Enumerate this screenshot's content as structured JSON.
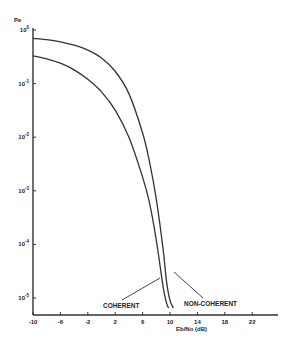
{
  "chart_data": {
    "type": "line",
    "title": "",
    "xlabel": "Eb/No (dB)",
    "ylabel": "Pe",
    "xscale": "linear",
    "yscale": "log",
    "xlim": [
      -10,
      30
    ],
    "ylim": [
      1e-05,
      1
    ],
    "x_ticks": [
      -10,
      -6,
      -2,
      2,
      6,
      10,
      14,
      18,
      22
    ],
    "x_tick_labels": [
      "-10",
      "-6",
      "-2",
      "2",
      "6",
      "10",
      "14",
      "18",
      "22"
    ],
    "y_ticks": [
      1,
      0.1,
      0.01,
      0.001,
      0.0001,
      1e-05
    ],
    "y_tick_labels": [
      {
        "base": "10",
        "exp": "0"
      },
      {
        "base": "10",
        "exp": "-1"
      },
      {
        "base": "10",
        "exp": "-2"
      },
      {
        "base": "10",
        "exp": "-3"
      },
      {
        "base": "10",
        "exp": "-4"
      },
      {
        "base": "10",
        "exp": "-5"
      }
    ],
    "grid": false,
    "legend": "none (curves labelled by annotations with leader lines)",
    "series": [
      {
        "name": "NON-COHERENT",
        "x": [
          -10,
          -8,
          -6,
          -4,
          -2,
          0,
          2,
          4,
          6,
          7,
          8,
          9,
          9.5,
          10,
          10.5
        ],
        "y": [
          0.7,
          0.66,
          0.6,
          0.52,
          0.42,
          0.3,
          0.17,
          0.065,
          0.012,
          0.0035,
          0.0007,
          8e-05,
          2e-05,
          9e-06,
          6.5e-06
        ]
      },
      {
        "name": "COHERENT",
        "x": [
          -10,
          -8,
          -6,
          -4,
          -2,
          0,
          2,
          4,
          6,
          7,
          8,
          9,
          9.5,
          9.8
        ],
        "y": [
          0.33,
          0.29,
          0.24,
          0.18,
          0.12,
          0.07,
          0.032,
          0.01,
          0.0018,
          0.0006,
          0.00012,
          1.6e-05,
          8e-06,
          6.5e-06
        ]
      }
    ],
    "annotations": [
      {
        "text": "COHERENT",
        "points_to": "COHERENT curve near Eb/No≈9.5 dB, Pe≈3e-5"
      },
      {
        "text": "NON-COHERENT",
        "points_to": "NON-COHERENT curve near Eb/No≈10.5 dB, Pe≈3e-5"
      }
    ]
  },
  "labels": {
    "ylabel": "Pe",
    "xlabel": "Eb/No (dB)",
    "ann_coherent": "COHERENT",
    "ann_noncoherent": "NON-COHERENT"
  }
}
